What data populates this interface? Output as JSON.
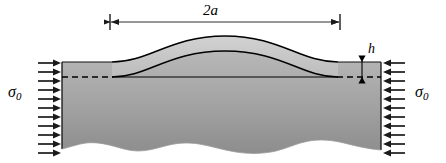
{
  "figure": {
    "labels": {
      "width_label": "2a",
      "height_label": "h",
      "stress_left_symbol": "σ",
      "stress_left_subscript": "0",
      "stress_right_symbol": "σ",
      "stress_right_subscript": "0"
    },
    "colors": {
      "substrate_fill_top": "#b4b4b4",
      "substrate_fill_bottom": "#8f8f8f",
      "film_fill": "#c9c9c9",
      "outline": "#000000",
      "background": "#ffffff",
      "arrow_color": "#1a1a1a"
    },
    "geometry": {
      "block_left_x": 62,
      "block_right_x": 381,
      "block_top_y": 62,
      "dashed_line_y": 77,
      "blister_left_x": 112,
      "blister_right_x": 338,
      "blister_peak_x": 225,
      "blister_peak_y": 36,
      "film_thickness_px": 15,
      "dimension_line_y": 22,
      "dimension_left_x": 110,
      "dimension_right_x": 340,
      "h_arrow_x": 362,
      "load_arrow_count_left": 10,
      "load_arrow_count_right": 10
    },
    "annotations": {
      "dimension_arrow": "double-headed-horizontal-arrow",
      "thickness_arrow": "double-headed-vertical-arrow",
      "left_load_arrows": "rightward-arrows",
      "right_load_arrows": "leftward-arrows",
      "bottom_edge": "torn-wavy-edge",
      "interface": "dashed-line"
    }
  }
}
